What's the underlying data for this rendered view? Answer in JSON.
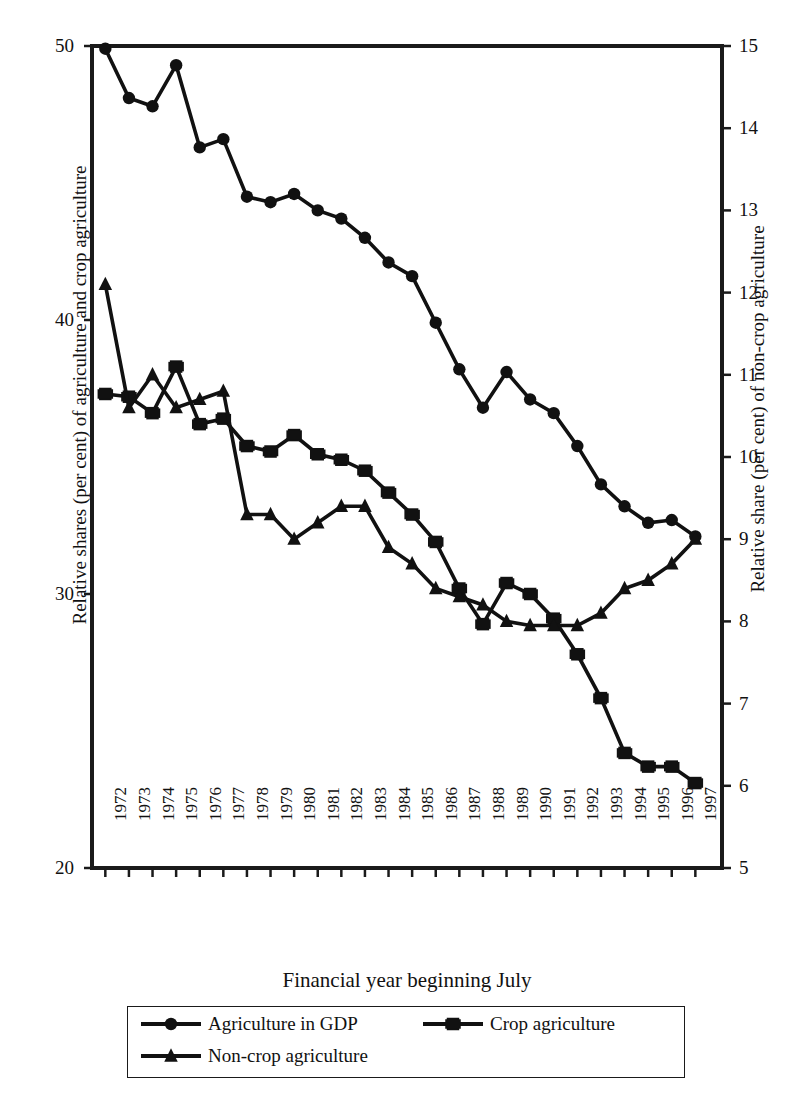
{
  "chart_data": {
    "type": "line",
    "title": "",
    "xlabel": "Financial year beginning July",
    "ylabel": "Relative shares (per cent) of  agriculture and crop agriculture",
    "ylabel_right": "Relative share (per cent) of non-crop agriculture",
    "grid": false,
    "legend_position": "bottom",
    "x": [
      1972,
      1973,
      1974,
      1975,
      1976,
      1977,
      1978,
      1979,
      1980,
      1981,
      1982,
      1983,
      1984,
      1985,
      1986,
      1987,
      1988,
      1989,
      1990,
      1991,
      1992,
      1993,
      1994,
      1995,
      1996,
      1997
    ],
    "xticklabels": [
      "1972",
      "1973",
      "1974",
      "1975",
      "1976",
      "1977",
      "1978",
      "1979",
      "1980",
      "1981",
      "1982",
      "1983",
      "1984",
      "1985",
      "1986",
      "1987",
      "1988",
      "1989",
      "1990",
      "1991",
      "1992",
      "1993",
      "1994",
      "1995",
      "1996",
      "1997"
    ],
    "ylim": [
      20,
      50
    ],
    "yticks": [
      20,
      30,
      40,
      50
    ],
    "yticklabels": [
      "20",
      "30",
      "40",
      "50"
    ],
    "ylim_right": [
      5,
      15
    ],
    "yticks_right": [
      5,
      6,
      7,
      8,
      9,
      10,
      11,
      12,
      13,
      14,
      15
    ],
    "yticklabels_right": [
      "5",
      "6",
      "7",
      "8",
      "9",
      "10",
      "11",
      "12",
      "13",
      "14",
      "15"
    ],
    "series": [
      {
        "name": "Agriculture in GDP",
        "axis": "left",
        "marker": "circle",
        "color": "#111111",
        "values": [
          49.9,
          48.1,
          47.8,
          49.3,
          46.3,
          46.6,
          44.5,
          44.3,
          44.6,
          44.0,
          43.7,
          43.0,
          42.1,
          41.6,
          39.9,
          38.2,
          36.8,
          38.1,
          37.1,
          36.6,
          35.4,
          34.0,
          33.2,
          32.6,
          32.7,
          32.1
        ]
      },
      {
        "name": "Crop agriculture",
        "axis": "left",
        "marker": "square",
        "color": "#111111",
        "values": [
          37.3,
          37.2,
          36.6,
          38.3,
          36.2,
          36.4,
          35.4,
          35.2,
          35.8,
          35.1,
          34.9,
          34.5,
          33.7,
          32.9,
          31.9,
          30.2,
          28.9,
          30.4,
          30.0,
          29.1,
          27.8,
          26.2,
          24.2,
          23.7,
          23.7,
          23.1
        ]
      },
      {
        "name": "Non-crop agriculture",
        "axis": "right",
        "marker": "triangle",
        "color": "#111111",
        "values": [
          12.1,
          10.6,
          11.0,
          10.6,
          10.7,
          10.8,
          9.3,
          9.3,
          9.0,
          9.2,
          9.4,
          9.4,
          8.9,
          8.7,
          8.4,
          8.3,
          8.2,
          8.0,
          7.95,
          7.95,
          7.95,
          8.1,
          8.4,
          8.5,
          8.7,
          9.0
        ]
      }
    ]
  },
  "legend": {
    "items": [
      {
        "label": "Agriculture in GDP",
        "marker": "circle"
      },
      {
        "label": "Crop agriculture",
        "marker": "square"
      },
      {
        "label": "Non-crop agriculture",
        "marker": "triangle"
      }
    ]
  }
}
